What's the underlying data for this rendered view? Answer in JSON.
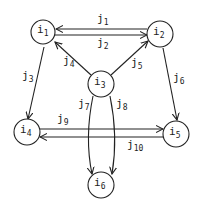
{
  "diagram": {
    "type": "directed-graph",
    "nodes": [
      {
        "id": "i1",
        "base": "i",
        "sub": "1",
        "x": 43,
        "y": 32
      },
      {
        "id": "i2",
        "base": "i",
        "sub": "2",
        "x": 160,
        "y": 34
      },
      {
        "id": "i3",
        "base": "i",
        "sub": "3",
        "x": 101,
        "y": 84
      },
      {
        "id": "i4",
        "base": "i",
        "sub": "4",
        "x": 27,
        "y": 132
      },
      {
        "id": "i5",
        "base": "i",
        "sub": "5",
        "x": 176,
        "y": 134
      },
      {
        "id": "i6",
        "base": "i",
        "sub": "6",
        "x": 101,
        "y": 185
      }
    ],
    "edges": [
      {
        "id": "j1",
        "base": "j",
        "sub": "1",
        "from": "i2",
        "to": "i1"
      },
      {
        "id": "j2",
        "base": "j",
        "sub": "2",
        "from": "i1",
        "to": "i2"
      },
      {
        "id": "j3",
        "base": "j",
        "sub": "3",
        "from": "i1",
        "to": "i4"
      },
      {
        "id": "j4",
        "base": "j",
        "sub": "4",
        "from": "i3",
        "to": "i1"
      },
      {
        "id": "j5",
        "base": "j",
        "sub": "5",
        "from": "i3",
        "to": "i2"
      },
      {
        "id": "j6",
        "base": "j",
        "sub": "6",
        "from": "i2",
        "to": "i5"
      },
      {
        "id": "j7",
        "base": "j",
        "sub": "7",
        "from": "i3",
        "to": "i6"
      },
      {
        "id": "j8",
        "base": "j",
        "sub": "8",
        "from": "i3",
        "to": "i6"
      },
      {
        "id": "j9",
        "base": "j",
        "sub": "9",
        "from": "i4",
        "to": "i5"
      },
      {
        "id": "j10",
        "base": "j",
        "sub": "10",
        "from": "i5",
        "to": "i4"
      }
    ]
  }
}
